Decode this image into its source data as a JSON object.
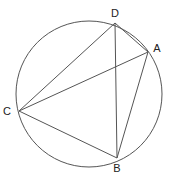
{
  "diagram": {
    "type": "geometry",
    "circle": {
      "cx": 89,
      "cy": 94,
      "r": 73
    },
    "points": [
      {
        "name": "A",
        "x": 148,
        "y": 52,
        "lx": 157,
        "ly": 52
      },
      {
        "name": "B",
        "x": 117,
        "y": 158,
        "lx": 117,
        "ly": 172
      },
      {
        "name": "C",
        "x": 19,
        "y": 111,
        "lx": 7,
        "ly": 115
      },
      {
        "name": "D",
        "x": 115,
        "y": 23,
        "lx": 115,
        "ly": 17
      }
    ],
    "segments": [
      [
        "D",
        "A"
      ],
      [
        "A",
        "B"
      ],
      [
        "B",
        "C"
      ],
      [
        "C",
        "D"
      ],
      [
        "C",
        "A"
      ],
      [
        "D",
        "B"
      ]
    ],
    "stroke_color": "#555555"
  }
}
